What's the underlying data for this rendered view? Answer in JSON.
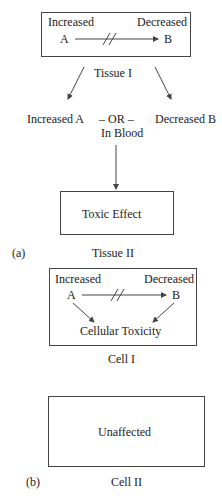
{
  "panel_a": {
    "label": "(a)",
    "tissue1": {
      "box_left": "Increased",
      "box_right": "Decreased",
      "node_a": "A",
      "node_b": "B",
      "caption": "Tissue I",
      "arrow": "blocked"
    },
    "blood": {
      "left": "Increased A",
      "middle": "– OR –",
      "right": "Decreased B",
      "sub": "In Blood"
    },
    "tissue2": {
      "box_text": "Toxic Effect",
      "caption": "Tissue II"
    }
  },
  "panel_b": {
    "label": "(b)",
    "cell1": {
      "box_left": "Increased",
      "box_right": "Decreased",
      "node_a": "A",
      "node_b": "B",
      "result": "Cellular Toxicity",
      "caption": "Cell I"
    },
    "cell2": {
      "box_text": "Unaffected",
      "caption": "Cell II"
    }
  },
  "colors": {
    "line": "#444444",
    "text": "#222222",
    "background": "#ffffff"
  }
}
